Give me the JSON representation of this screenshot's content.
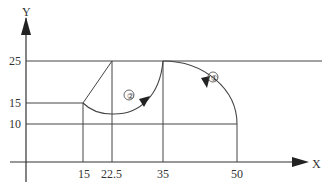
{
  "diagram": {
    "type": "cnc-toolpath-coordinate-diagram",
    "axes": {
      "x_label": "X",
      "y_label": "Y",
      "x_ticks": [
        "15",
        "22.5",
        "35",
        "50"
      ],
      "y_ticks": [
        "25",
        "15",
        "10"
      ]
    },
    "points": [
      {
        "x": 15,
        "y": 15
      },
      {
        "x": 22.5,
        "y": 25
      },
      {
        "x": 35,
        "y": 25
      },
      {
        "x": 50,
        "y": 10
      }
    ],
    "arcs": [
      {
        "label": "①",
        "from": [
          50,
          10
        ],
        "to": [
          35,
          25
        ],
        "direction": "counter-clockwise"
      },
      {
        "label": "②",
        "from": [
          35,
          25
        ],
        "to": [
          15,
          15
        ],
        "direction": "clockwise"
      }
    ],
    "segments": [
      {
        "from": [
          15,
          15
        ],
        "to": [
          22.5,
          25
        ]
      }
    ]
  }
}
